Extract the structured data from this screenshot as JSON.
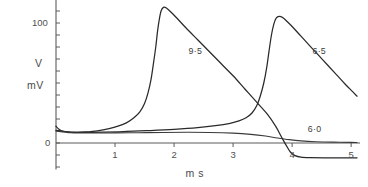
{
  "chart_data": {
    "type": "line",
    "title": "",
    "xlabel": "m s",
    "ylabel_line1": "V",
    "ylabel_line2": "mV",
    "xlim": [
      0,
      5.15
    ],
    "ylim": [
      -22,
      125
    ],
    "xticks": [
      1,
      2,
      3,
      4,
      5
    ],
    "xtick_labels": [
      "1",
      "2",
      "3",
      "4",
      "5"
    ],
    "yticks": [
      -20,
      -10,
      0,
      10,
      20,
      30,
      40,
      50,
      60,
      70,
      80,
      90,
      100,
      110,
      120
    ],
    "ytick_labels_shown": [
      {
        "value": 100,
        "label": "100"
      },
      {
        "value": 0,
        "label": "0"
      }
    ],
    "grid": false,
    "legend_position": "inline-annotations",
    "series": [
      {
        "name": "9·5",
        "label": "9·5",
        "label_x": 2.36,
        "label_y": 76,
        "points": [
          [
            0.0,
            14.0
          ],
          [
            0.05,
            11.5
          ],
          [
            0.12,
            9.8
          ],
          [
            0.22,
            9.0
          ],
          [
            0.35,
            8.8
          ],
          [
            0.5,
            9.2
          ],
          [
            0.7,
            10.2
          ],
          [
            0.9,
            12.0
          ],
          [
            1.05,
            14.0
          ],
          [
            1.2,
            17.0
          ],
          [
            1.32,
            21.0
          ],
          [
            1.42,
            26.0
          ],
          [
            1.5,
            33.0
          ],
          [
            1.56,
            42.0
          ],
          [
            1.61,
            53.0
          ],
          [
            1.65,
            66.0
          ],
          [
            1.69,
            80.0
          ],
          [
            1.72,
            93.0
          ],
          [
            1.75,
            103.0
          ],
          [
            1.78,
            110.0
          ],
          [
            1.82,
            113.0
          ],
          [
            1.87,
            112.5
          ],
          [
            1.95,
            109.0
          ],
          [
            2.05,
            104.0
          ],
          [
            2.2,
            96.0
          ],
          [
            2.4,
            86.0
          ],
          [
            2.6,
            76.0
          ],
          [
            2.8,
            66.0
          ],
          [
            3.0,
            56.0
          ],
          [
            3.2,
            45.0
          ],
          [
            3.4,
            34.0
          ],
          [
            3.58,
            24.0
          ],
          [
            3.72,
            14.0
          ],
          [
            3.82,
            5.0
          ],
          [
            3.9,
            -2.0
          ],
          [
            3.97,
            -7.5
          ],
          [
            4.05,
            -10.5
          ],
          [
            4.15,
            -11.8
          ],
          [
            4.3,
            -12.2
          ],
          [
            4.6,
            -12.3
          ],
          [
            5.0,
            -12.3
          ],
          [
            5.1,
            -12.3
          ]
        ]
      },
      {
        "name": "6·5",
        "label": "6·5",
        "label_x": 4.46,
        "label_y": 76,
        "points": [
          [
            0.0,
            10.5
          ],
          [
            0.2,
            9.2
          ],
          [
            0.45,
            8.8
          ],
          [
            0.8,
            9.0
          ],
          [
            1.2,
            9.6
          ],
          [
            1.6,
            10.4
          ],
          [
            2.0,
            11.4
          ],
          [
            2.4,
            12.8
          ],
          [
            2.7,
            14.4
          ],
          [
            2.95,
            16.4
          ],
          [
            3.1,
            18.4
          ],
          [
            3.22,
            21.0
          ],
          [
            3.32,
            25.0
          ],
          [
            3.4,
            31.0
          ],
          [
            3.46,
            39.0
          ],
          [
            3.52,
            50.0
          ],
          [
            3.57,
            63.0
          ],
          [
            3.61,
            77.0
          ],
          [
            3.65,
            90.0
          ],
          [
            3.69,
            99.0
          ],
          [
            3.73,
            104.0
          ],
          [
            3.78,
            105.5
          ],
          [
            3.84,
            104.5
          ],
          [
            3.92,
            101.0
          ],
          [
            4.02,
            96.0
          ],
          [
            4.15,
            89.0
          ],
          [
            4.3,
            81.0
          ],
          [
            4.45,
            73.0
          ],
          [
            4.6,
            65.0
          ],
          [
            4.75,
            57.0
          ],
          [
            4.9,
            49.0
          ],
          [
            5.02,
            43.0
          ],
          [
            5.1,
            39.0
          ]
        ]
      },
      {
        "name": "6·0",
        "label": "6·0",
        "label_x": 4.38,
        "label_y": 10.5,
        "points": [
          [
            0.0,
            10.0
          ],
          [
            0.25,
            8.6
          ],
          [
            0.6,
            8.3
          ],
          [
            1.0,
            8.4
          ],
          [
            1.4,
            8.6
          ],
          [
            1.8,
            8.8
          ],
          [
            2.2,
            8.9
          ],
          [
            2.6,
            8.8
          ],
          [
            3.0,
            8.2
          ],
          [
            3.3,
            7.2
          ],
          [
            3.55,
            5.8
          ],
          [
            3.75,
            4.2
          ],
          [
            3.95,
            2.8
          ],
          [
            4.15,
            1.8
          ],
          [
            4.4,
            1.1
          ],
          [
            4.7,
            0.7
          ],
          [
            5.0,
            0.5
          ],
          [
            5.1,
            0.4
          ]
        ]
      }
    ]
  },
  "axis": {
    "y_label_top": "V",
    "y_label_bottom": "mV",
    "y_tick_100": "100",
    "y_tick_0": "0",
    "x_axis_title": "m s",
    "x_tick_1": "1",
    "x_tick_2": "2",
    "x_tick_3": "3",
    "x_tick_4": "4",
    "x_tick_5": "5"
  },
  "annotations": {
    "curve_9_5": "9·5",
    "curve_6_5": "6·5",
    "curve_6_0": "6·0"
  },
  "colors": {
    "background": "#ffffff",
    "axis": "#5b5b5b",
    "curve": "#2a2a2a",
    "text": "#4a4a4a"
  }
}
